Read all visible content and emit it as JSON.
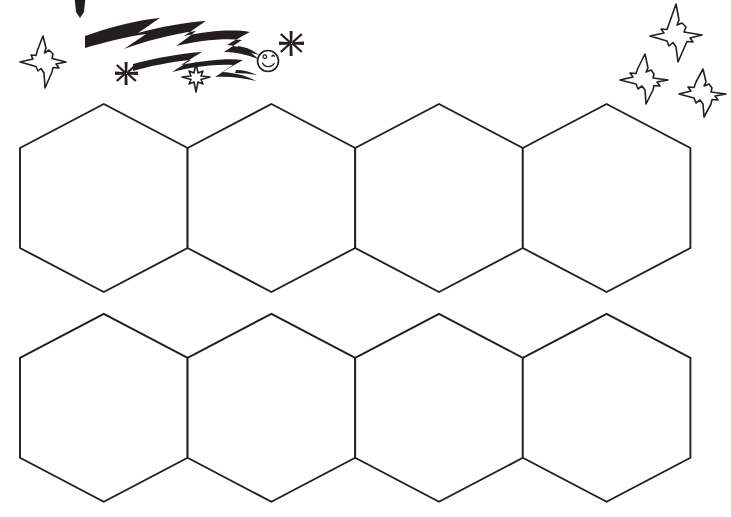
{
  "document": {
    "title": "Hexagon Honeycomb Template",
    "kind": "printable-line-art-worksheet",
    "background_color": "#ffffff",
    "ink_color": "#231f20",
    "canvas": {
      "width": 731,
      "height": 517
    }
  },
  "artwork": {
    "style": "black-and-white-line-drawing",
    "stroke_color": "#231f20",
    "stroke_width": 1.9,
    "fill_color": "#ffffff"
  },
  "hex_grid": {
    "name": "hexagon-honeycomb-grid",
    "orientation": "pointy-top",
    "rows": 2,
    "columns_per_row": 4,
    "total_hexagons": 8,
    "shape_width": 168,
    "shape_height": 188,
    "horizontal_pitch": 167.6,
    "side_vertical_run": 100,
    "cap_height": 44,
    "row_top_y": [
      104,
      313
    ],
    "row_bottom_y": [
      292,
      503
    ],
    "grid_left_x": 20,
    "grid_right_x": 691,
    "cells": [
      {
        "id": "hex-r1-c1",
        "row": 1,
        "column": 1,
        "center_x": 104,
        "center_y": 198,
        "label": ""
      },
      {
        "id": "hex-r1-c2",
        "row": 1,
        "column": 2,
        "center_x": 272,
        "center_y": 198,
        "label": ""
      },
      {
        "id": "hex-r1-c3",
        "row": 1,
        "column": 3,
        "center_x": 439,
        "center_y": 198,
        "label": ""
      },
      {
        "id": "hex-r1-c4",
        "row": 1,
        "column": 4,
        "center_x": 607,
        "center_y": 198,
        "label": ""
      },
      {
        "id": "hex-r2-c1",
        "row": 2,
        "column": 1,
        "center_x": 104,
        "center_y": 408,
        "label": ""
      },
      {
        "id": "hex-r2-c2",
        "row": 2,
        "column": 2,
        "center_x": 272,
        "center_y": 408,
        "label": ""
      },
      {
        "id": "hex-r2-c3",
        "row": 2,
        "column": 3,
        "center_x": 439,
        "center_y": 408,
        "label": ""
      },
      {
        "id": "hex-r2-c4",
        "row": 2,
        "column": 4,
        "center_x": 607,
        "center_y": 408,
        "label": ""
      }
    ]
  },
  "decorations": {
    "comet": {
      "name": "shooting-star-comet",
      "description": "Comet with a round smiling-swirl head at the lower right and a long jagged zig-zag tail sweeping up to the left",
      "head_center_x": 268,
      "head_center_y": 61,
      "head_radius": 11,
      "tail_start_x": 85,
      "tail_end_x": 258
    },
    "stars": [
      {
        "id": "star-large-left",
        "name": "four-point-sparkle-star",
        "center_x": 43,
        "center_y": 62,
        "size": 52
      },
      {
        "id": "star-small-mid",
        "name": "four-point-sparkle-star",
        "center_x": 196,
        "center_y": 77,
        "size": 28
      },
      {
        "id": "star-topright-upper",
        "name": "four-point-sparkle-star",
        "center_x": 676,
        "center_y": 33,
        "size": 56
      },
      {
        "id": "star-topright-left",
        "name": "four-point-sparkle-star",
        "center_x": 644,
        "center_y": 76,
        "size": 44
      },
      {
        "id": "star-topright-lower",
        "name": "four-point-sparkle-star",
        "center_x": 702,
        "center_y": 90,
        "size": 42
      }
    ],
    "asterisks": [
      {
        "id": "asterisk-left",
        "name": "asterisk-sparkle",
        "center_x": 126,
        "center_y": 73,
        "size": 18
      },
      {
        "id": "asterisk-right",
        "name": "asterisk-sparkle",
        "center_x": 291,
        "center_y": 43,
        "size": 20
      }
    ],
    "stray_mark": {
      "id": "stray-tick-top",
      "name": "stray-ink-tick",
      "center_x": 80,
      "center_y": 5,
      "description": "small partial ink mark clipped at top edge"
    }
  }
}
